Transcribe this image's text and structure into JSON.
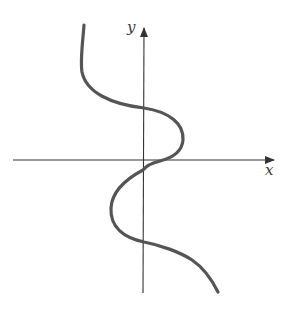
{
  "figure": {
    "axes": {
      "x_label": "x",
      "y_label": "y",
      "axis_color": "#333333"
    },
    "curve": {
      "color": "#555555",
      "features": [
        "vertical top branch in upper-left quadrant",
        "crosses positive y-axis",
        "bulges right into first quadrant",
        "crosses positive x-axis near origin",
        "crosses negative y-axis just below origin",
        "bulges left into third quadrant",
        "crosses negative y-axis lower",
        "descends into fourth quadrant toward lower right"
      ]
    }
  }
}
